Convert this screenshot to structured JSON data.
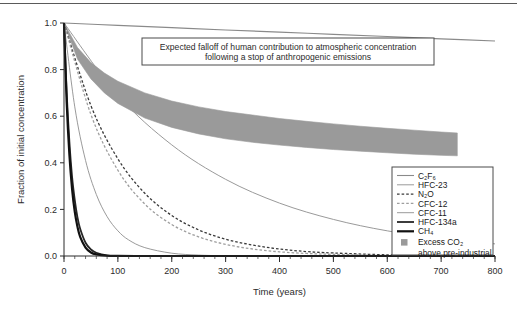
{
  "figure": {
    "background_color": "#ffffff",
    "top_rule": true,
    "annotation_box": {
      "line1": "Expected falloff of human contribution to atmospheric concentration",
      "line2": "following a stop of anthropogenic emissions",
      "border_color": "#4a4a4a"
    }
  },
  "chart_data": {
    "type": "line",
    "xlabel": "Time (years)",
    "ylabel": "Fraction of initial concentration",
    "xlim": [
      0,
      800
    ],
    "ylim": [
      0.0,
      1.0
    ],
    "xticks": [
      0,
      100,
      200,
      300,
      400,
      500,
      600,
      700,
      800
    ],
    "xticklabels": [
      "0",
      "100",
      "200",
      "300",
      "400",
      "500",
      "600",
      "700",
      "800"
    ],
    "yticks": [
      0.0,
      0.2,
      0.4,
      0.6,
      0.8,
      1.0
    ],
    "yticklabels": [
      "0.0",
      "0.2",
      "0.4",
      "0.6",
      "0.8",
      "1.0"
    ],
    "minor_xticks_interval": 20,
    "grid": false,
    "legend_position": "right-inside-lower",
    "series": [
      {
        "name": "C2F6",
        "label": "C₂F₆",
        "style": "solid",
        "color": "#8a8a8a",
        "width": 1.1,
        "comment": "lifetime 10000 yr; essentially flat slow decay",
        "x": [
          0,
          100,
          200,
          300,
          400,
          500,
          600,
          700,
          800
        ],
        "y": [
          1.0,
          0.99,
          0.98,
          0.97,
          0.961,
          0.951,
          0.942,
          0.932,
          0.923
        ]
      },
      {
        "name": "HFC-23",
        "label": "HFC-23",
        "style": "solid",
        "color": "#9a9a9a",
        "width": 1.0,
        "comment": "lifetime ~270 yr",
        "x": [
          0,
          100,
          200,
          300,
          400,
          500,
          600,
          700,
          800
        ],
        "y": [
          1.0,
          0.69,
          0.477,
          0.329,
          0.227,
          0.157,
          0.108,
          0.075,
          0.052
        ]
      },
      {
        "name": "N2O",
        "label": "N₂O",
        "style": "dashed",
        "color": "#3a3a3a",
        "width": 1.3,
        "comment": "lifetime ~114 yr",
        "x": [
          0,
          50,
          100,
          150,
          200,
          250,
          300,
          350,
          400,
          450,
          500,
          600,
          700,
          800
        ],
        "y": [
          1.0,
          0.645,
          0.417,
          0.269,
          0.174,
          0.112,
          0.072,
          0.047,
          0.03,
          0.019,
          0.013,
          0.005,
          0.002,
          0.001
        ]
      },
      {
        "name": "CFC-12",
        "label": "CFC-12",
        "style": "dashed",
        "color": "#9e9e9e",
        "width": 1.3,
        "comment": "lifetime ~100 yr",
        "x": [
          0,
          50,
          100,
          150,
          200,
          250,
          300,
          350,
          400,
          450,
          500,
          600,
          700,
          800
        ],
        "y": [
          1.0,
          0.607,
          0.368,
          0.223,
          0.135,
          0.082,
          0.05,
          0.03,
          0.018,
          0.011,
          0.007,
          0.002,
          0.001,
          0.0
        ]
      },
      {
        "name": "CFC-11",
        "label": "CFC-11",
        "style": "solid",
        "color": "#8f8f8f",
        "width": 0.9,
        "comment": "lifetime ~45 yr",
        "x": [
          0,
          20,
          40,
          60,
          80,
          100,
          120,
          150,
          200,
          250,
          300,
          400,
          500,
          600,
          700,
          800
        ],
        "y": [
          1.0,
          0.64,
          0.41,
          0.264,
          0.169,
          0.108,
          0.069,
          0.036,
          0.012,
          0.004,
          0.0014,
          0.0002,
          0.0,
          0.0,
          0.0,
          0.0
        ]
      },
      {
        "name": "HFC-134a",
        "label": "HFC-134a",
        "style": "solid",
        "color": "#262626",
        "width": 1.8,
        "comment": "lifetime ~14 yr",
        "x": [
          0,
          5,
          10,
          15,
          20,
          25,
          30,
          40,
          50,
          60,
          80,
          100,
          150,
          200,
          400,
          600,
          800
        ],
        "y": [
          1.0,
          0.7,
          0.49,
          0.34,
          0.24,
          0.166,
          0.117,
          0.057,
          0.028,
          0.014,
          0.003,
          0.001,
          0.0,
          0.0,
          0.0,
          0.0,
          0.0
        ]
      },
      {
        "name": "CH4",
        "label": "CH₄",
        "style": "solid",
        "color": "#111111",
        "width": 2.2,
        "comment": "lifetime ~12 yr",
        "x": [
          0,
          5,
          10,
          15,
          20,
          25,
          30,
          40,
          50,
          60,
          80,
          100,
          150,
          200,
          400,
          600,
          800
        ],
        "y": [
          1.0,
          0.659,
          0.435,
          0.287,
          0.189,
          0.125,
          0.082,
          0.036,
          0.015,
          0.007,
          0.001,
          0.0,
          0.0,
          0.0,
          0.0,
          0.0,
          0.0
        ]
      }
    ],
    "band": {
      "name": "Excess CO2 above pre-industrial",
      "label_line1": "Excess CO₂",
      "label_line2": "above pre-industrial",
      "color": "#9a9a9a",
      "x": [
        0,
        25,
        50,
        75,
        100,
        150,
        200,
        250,
        300,
        350,
        400,
        450,
        500,
        550,
        600,
        650,
        700,
        730
      ],
      "y_upper": [
        1.0,
        0.895,
        0.83,
        0.785,
        0.75,
        0.7,
        0.665,
        0.64,
        0.62,
        0.605,
        0.59,
        0.578,
        0.567,
        0.557,
        0.548,
        0.54,
        0.532,
        0.528
      ],
      "y_lower": [
        1.0,
        0.845,
        0.76,
        0.7,
        0.655,
        0.592,
        0.552,
        0.524,
        0.503,
        0.488,
        0.476,
        0.466,
        0.457,
        0.45,
        0.443,
        0.437,
        0.432,
        0.43
      ]
    }
  },
  "legend": {
    "items": [
      {
        "label": "C₂F₆",
        "style": "solid",
        "color": "#8a8a8a",
        "width": 1.1
      },
      {
        "label": "HFC-23",
        "style": "solid",
        "color": "#9a9a9a",
        "width": 1.0
      },
      {
        "label": "N₂O",
        "style": "dashed",
        "color": "#3a3a3a",
        "width": 1.3
      },
      {
        "label": "CFC-12",
        "style": "dashed",
        "color": "#9e9e9e",
        "width": 1.3
      },
      {
        "label": "CFC-11",
        "style": "solid",
        "color": "#8f8f8f",
        "width": 0.9
      },
      {
        "label": "HFC-134a",
        "style": "solid",
        "color": "#262626",
        "width": 1.8
      },
      {
        "label": "CH₄",
        "style": "solid",
        "color": "#111111",
        "width": 2.2
      }
    ],
    "swatch": {
      "label_line1": "Excess CO₂",
      "label_line2": "above pre-industrial",
      "color": "#9a9a9a"
    },
    "border_color": "#4a4a4a"
  }
}
